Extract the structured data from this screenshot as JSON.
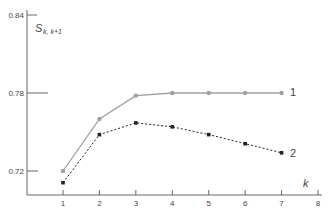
{
  "chart_data": {
    "type": "line",
    "title": "",
    "xlabel": "k",
    "ylabel": "S",
    "ylabel_subscript": "k, k+1",
    "x": [
      1,
      2,
      3,
      4,
      5,
      6,
      7
    ],
    "xticks": [
      "1",
      "2",
      "3",
      "4",
      "5",
      "6",
      "7",
      "8"
    ],
    "yticks": [
      "0.72",
      "0.78",
      "0.84"
    ],
    "xlim": [
      0,
      8
    ],
    "ylim": [
      0.704,
      0.84
    ],
    "grid": false,
    "legend_position": "inline-right",
    "series": [
      {
        "name": "1",
        "style": "solid",
        "marker": "circle",
        "color": "#a0a0a0",
        "values": [
          0.72,
          0.76,
          0.778,
          0.78,
          0.78,
          0.78,
          0.78
        ]
      },
      {
        "name": "2",
        "style": "dotted",
        "marker": "square",
        "color": "#222222",
        "values": [
          0.711,
          0.748,
          0.757,
          0.754,
          0.748,
          0.741,
          0.734
        ]
      }
    ]
  },
  "labels": {
    "y_tick_084": "0.84",
    "y_tick_078": "0.78",
    "y_tick_072": "0.72",
    "x_title": "k",
    "y_title": "S",
    "y_title_sub": "k, k+1",
    "series1": "1",
    "series2": "2"
  }
}
